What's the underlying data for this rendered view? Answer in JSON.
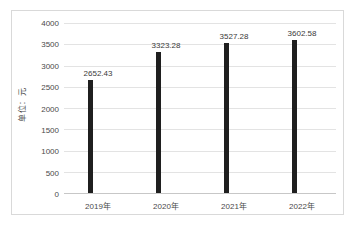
{
  "chart_data": {
    "type": "bar",
    "title": "",
    "subtitle": "",
    "xlabel": "",
    "ylabel": "单位：元",
    "categories": [
      "2019年",
      "2020年",
      "2021年",
      "2022年"
    ],
    "values": [
      2652.43,
      3323.28,
      3527.28,
      3602.58
    ],
    "value_labels": [
      "2652.43",
      "3323.28",
      "3527.28",
      "3602.58"
    ],
    "ylim": [
      0,
      4000
    ],
    "ytick_labels": [
      "4000",
      "3500",
      "3000",
      "2500",
      "2000",
      "1500",
      "1000",
      "500",
      "0"
    ],
    "ytick_values": [
      4000,
      3500,
      3000,
      2500,
      2000,
      1500,
      1000,
      500,
      0
    ],
    "grid": true,
    "legend": false,
    "legend_position": "none",
    "series": [
      {
        "name": "",
        "values": [
          2652.43,
          3323.28,
          3527.28,
          3602.58
        ],
        "color": "#1f1f1f"
      }
    ]
  },
  "style": {
    "bar_color": "#1f1f1f",
    "gridline_color": "#e3e3e3",
    "axis_color": "#c7c7c7",
    "frame_color": "#d9d9d9",
    "background": "#ffffff",
    "text_color": "#4a4a4a"
  }
}
